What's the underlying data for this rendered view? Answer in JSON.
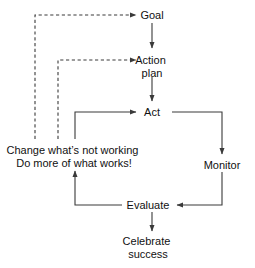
{
  "diagram": {
    "type": "flowchart",
    "title": "",
    "background_color": "#ffffff",
    "line_color": "#3a3a3a",
    "text_color": "#111111",
    "nodes": [
      {
        "id": "goal",
        "label": "Goal",
        "lines": [
          "Goal"
        ]
      },
      {
        "id": "action",
        "label": "Action plan",
        "lines": [
          "Action",
          "plan"
        ]
      },
      {
        "id": "act",
        "label": "Act",
        "lines": [
          "Act"
        ]
      },
      {
        "id": "monitor",
        "label": "Monitor",
        "lines": [
          "Monitor"
        ]
      },
      {
        "id": "evaluate",
        "label": "Evaluate",
        "lines": [
          "Evaluate"
        ]
      },
      {
        "id": "celebrate",
        "label": "Celebrate success",
        "lines": [
          "Celebrate",
          "success"
        ]
      },
      {
        "id": "change",
        "label": "Change what's not working Do more of what works!",
        "lines": [
          "Change what’s not working",
          "Do more of what works!"
        ]
      }
    ],
    "edges": [
      {
        "from": "change",
        "to": "goal",
        "style": "dashed",
        "arrow": true
      },
      {
        "from": "goal",
        "to": "action",
        "style": "solid",
        "arrow": true
      },
      {
        "from": "change",
        "to": "action",
        "style": "dashed",
        "arrow": true
      },
      {
        "from": "action",
        "to": "act",
        "style": "solid",
        "arrow": true
      },
      {
        "from": "change",
        "to": "act",
        "style": "solid",
        "arrow": true
      },
      {
        "from": "act",
        "to": "monitor",
        "style": "solid",
        "arrow": true
      },
      {
        "from": "monitor",
        "to": "evaluate",
        "style": "solid",
        "arrow": true
      },
      {
        "from": "evaluate",
        "to": "change",
        "style": "solid",
        "arrow": true
      },
      {
        "from": "evaluate",
        "to": "celebrate",
        "style": "solid",
        "arrow": true
      }
    ]
  }
}
